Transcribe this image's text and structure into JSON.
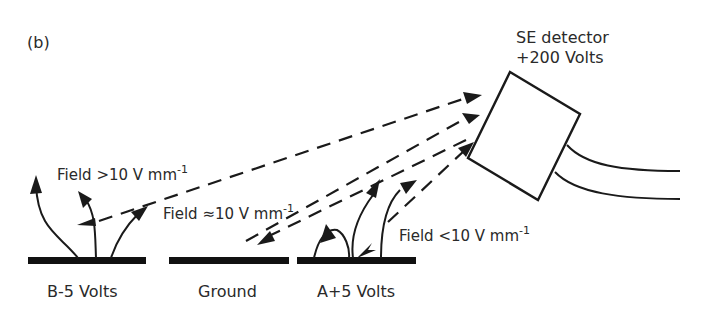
{
  "figure": {
    "panel_label": "(b)",
    "detector": {
      "name": "SE detector",
      "voltage": "+200 Volts"
    },
    "electrodes": [
      {
        "id": "B",
        "label": "B-5 Volts"
      },
      {
        "id": "ground",
        "label": "Ground"
      },
      {
        "id": "A",
        "label": "A+5 Volts"
      }
    ],
    "field_annotations": [
      {
        "prefix": "Field  >10 V mm",
        "exp": "-1"
      },
      {
        "prefix": "Field ≈10 V mm",
        "exp": "-1"
      },
      {
        "prefix": "Field  <10 V mm",
        "exp": "-1"
      }
    ]
  },
  "colors": {
    "ink": "#1a1a1a",
    "text": "#2a2a2a",
    "background": "#ffffff"
  }
}
